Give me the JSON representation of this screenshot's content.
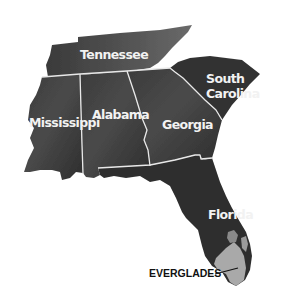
{
  "map": {
    "title": "Southeastern United States",
    "colors": {
      "land": "#3a3a3a",
      "land_light": "#5a5a5a",
      "border": "#e8e8e8",
      "everglades": "#a9a9a9",
      "label": "#f2f2f2",
      "callout": "#111111",
      "background": "#ffffff"
    },
    "states": [
      {
        "name": "Tennessee",
        "label": "Tennessee"
      },
      {
        "name": "South Carolina",
        "label_line1": "South",
        "label_line2": "Carolina"
      },
      {
        "name": "Mississippi",
        "label": "Mississippi"
      },
      {
        "name": "Alabama",
        "label": "Alabama"
      },
      {
        "name": "Georgia",
        "label": "Georgia"
      },
      {
        "name": "Florida",
        "label": "Florida"
      }
    ],
    "features": [
      {
        "name": "Everglades",
        "label": "EVERGLADES"
      }
    ]
  }
}
